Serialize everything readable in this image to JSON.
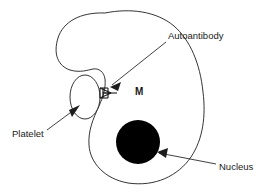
{
  "figure": {
    "type": "biological-diagram",
    "title_visible": false,
    "background_color": "#ffffff",
    "stroke_color": "#1d1d1a",
    "nucleus_color": "#000000"
  },
  "labels": {
    "autoantibody": "Autoantibody",
    "platelet": "Platelet",
    "nucleus": "Nucleus",
    "macrophage_marker": "M"
  },
  "shapes": {
    "cell": {
      "name": "macrophage-cell-body",
      "description": "kidney-bean shaped outline with left indentation",
      "fill": "#ffffff",
      "stroke": "#1d1d1d"
    },
    "platelet": {
      "name": "platelet-ellipse",
      "cx": 85,
      "cy": 97,
      "rx": 15,
      "ry": 22,
      "fill": "#ffffff",
      "stroke": "#1d1d1d"
    },
    "nucleus": {
      "name": "nucleus-circle",
      "cx": 138,
      "cy": 142,
      "r": 22,
      "fill": "#000000"
    },
    "antibody": {
      "name": "autoantibody-y-shape",
      "description": "Y-shaped antibody bridging platelet and cell membrane",
      "stroke": "#1d1d1d"
    }
  },
  "annotations": [
    {
      "id": "autoantibody",
      "label": "Autoantibody",
      "text_x": 168,
      "text_y": 36,
      "arrow_from": [
        166,
        42
      ],
      "arrow_to": [
        110,
        87
      ]
    },
    {
      "id": "platelet",
      "label": "Platelet",
      "text_x": 12,
      "text_y": 134,
      "arrow_from": [
        47,
        130
      ],
      "arrow_to": [
        80,
        105
      ]
    },
    {
      "id": "nucleus",
      "label": "Nucleus",
      "text_x": 219,
      "text_y": 167,
      "arrow_from": [
        216,
        164
      ],
      "arrow_to": [
        157,
        152
      ]
    }
  ]
}
